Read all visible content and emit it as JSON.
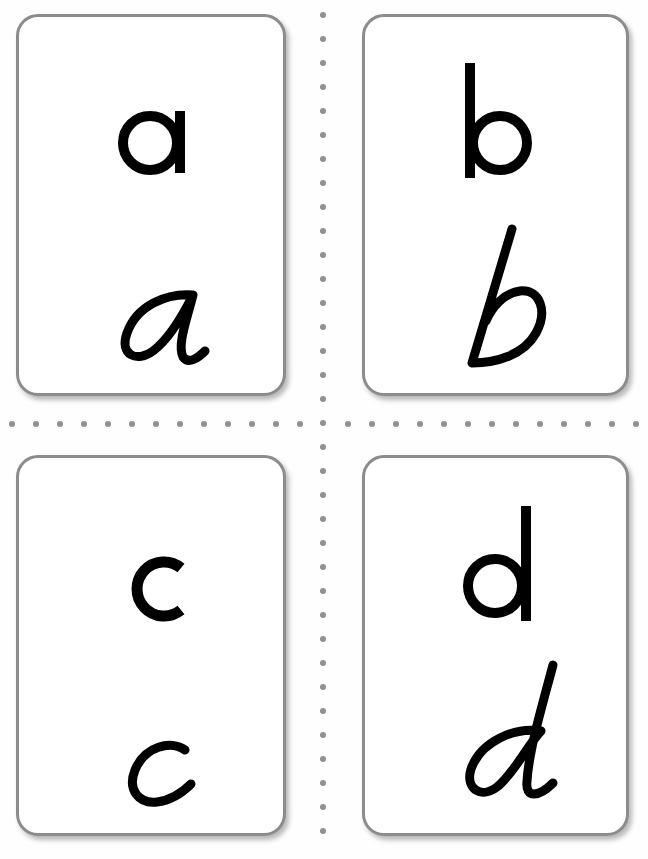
{
  "sheet": {
    "title": "Alphabet flash cards",
    "colors": {
      "card_border": "#8c8c8c",
      "dot": "#8f8f8f",
      "ink": "#000000",
      "background": "#ffffff"
    }
  },
  "cards": [
    {
      "id": "a",
      "print": "a",
      "cursive": "a"
    },
    {
      "id": "b",
      "print": "b",
      "cursive": "b"
    },
    {
      "id": "c",
      "print": "c",
      "cursive": "c"
    },
    {
      "id": "d",
      "print": "d",
      "cursive": "d"
    }
  ],
  "cut_guides": {
    "vertical": {
      "x": 323,
      "y_start": 15,
      "y_end": 845,
      "spacing": 24
    },
    "horizontal": {
      "y": 424,
      "x_start": 12,
      "x_end": 640,
      "spacing": 24
    }
  }
}
